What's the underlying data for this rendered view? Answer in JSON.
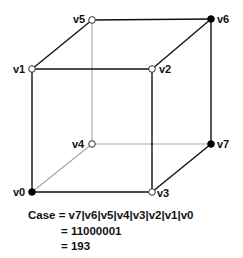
{
  "diagram": {
    "vertices": [
      {
        "id": "v0",
        "label": "v0",
        "x": 32,
        "y": 192,
        "set": true
      },
      {
        "id": "v1",
        "label": "v1",
        "x": 32,
        "y": 69,
        "set": false
      },
      {
        "id": "v2",
        "label": "v2",
        "x": 152,
        "y": 69,
        "set": false
      },
      {
        "id": "v3",
        "label": "v3",
        "x": 152,
        "y": 192,
        "set": false
      },
      {
        "id": "v4",
        "label": "v4",
        "x": 92,
        "y": 144,
        "set": false
      },
      {
        "id": "v5",
        "label": "v5",
        "x": 92,
        "y": 20,
        "set": false
      },
      {
        "id": "v6",
        "label": "v6",
        "x": 211,
        "y": 19,
        "set": true
      },
      {
        "id": "v7",
        "label": "v7",
        "x": 211,
        "y": 144,
        "set": true
      }
    ],
    "colors": {
      "front_edge": "#111111",
      "hidden_edge": "#aaaaaa",
      "set_vertex": "#000000",
      "unset_vertex": "#ffffff"
    }
  },
  "equation": {
    "line1_prefix": "Case",
    "line1": "= v7|v6|v5|v4|v3|v2|v1|v0",
    "line2": "= 11000001",
    "line3": "= 193"
  }
}
